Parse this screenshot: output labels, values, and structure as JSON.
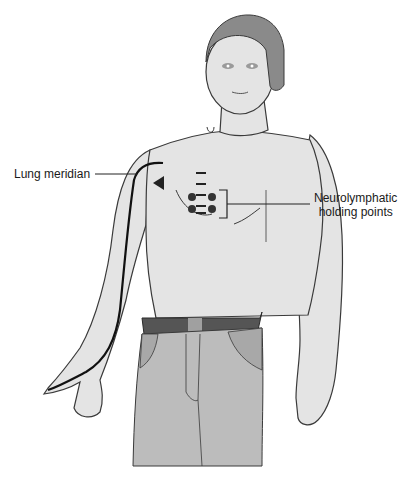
{
  "diagram": {
    "labels": {
      "lung_meridian": "Lung meridian",
      "neurolymphatic_line1": "Neurolymphatic",
      "neurolymphatic_line2": "holding points"
    },
    "colors": {
      "skin": "#e4e4e4",
      "outline": "#3a3a3a",
      "hair": "#8a8a8a",
      "belt": "#555555",
      "pants": "#bcbcbc",
      "pants_pocket": "#a8a8a8",
      "meridian": "#111111",
      "points": "#333333"
    }
  }
}
